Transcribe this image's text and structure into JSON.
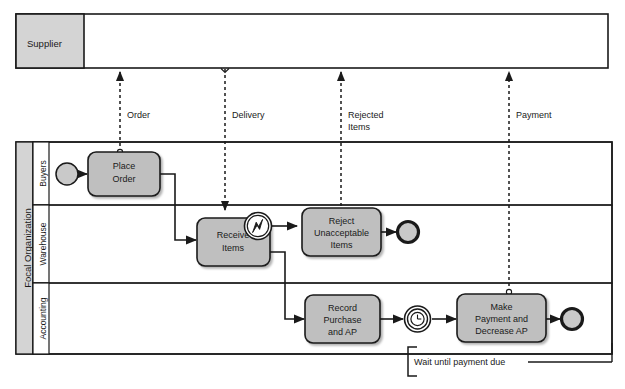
{
  "diagram": {
    "type": "bpmn-collaboration-diagram",
    "colors": {
      "lane_header_fill": "#d4d4d4",
      "task_fill": "#bfbfbf",
      "event_fill": "#c9c9c9",
      "stroke": "#1a1a1a",
      "background": "#ffffff"
    }
  },
  "pools": [
    {
      "id": "supplier",
      "name": "Supplier",
      "collapsed": true,
      "lanes": []
    },
    {
      "id": "focal-organization",
      "name": "Focal Organization",
      "collapsed": false,
      "lanes": [
        {
          "id": "buyers",
          "name": "Buyers"
        },
        {
          "id": "warehouse",
          "name": "Warehouse"
        },
        {
          "id": "accounting",
          "name": "Accounting"
        }
      ]
    }
  ],
  "tasks": [
    {
      "id": "place-order",
      "lane": "buyers",
      "line1": "Place",
      "line2": "Order",
      "line3": ""
    },
    {
      "id": "receive-items",
      "lane": "warehouse",
      "line1": "Receive",
      "line2": "Items",
      "line3": ""
    },
    {
      "id": "reject-unacceptable-items",
      "lane": "warehouse",
      "line1": "Reject",
      "line2": "Unacceptable",
      "line3": "Items"
    },
    {
      "id": "record-purchase-and-ap",
      "lane": "accounting",
      "line1": "Record",
      "line2": "Purchase",
      "line3": "and AP"
    },
    {
      "id": "make-payment-and-decrease-ap",
      "lane": "accounting",
      "line1": "Make",
      "line2": "Payment and",
      "line3": "Decrease AP"
    }
  ],
  "events": [
    {
      "id": "start-event-buyers",
      "kind": "start",
      "lane": "buyers"
    },
    {
      "id": "boundary-error-receive-items",
      "kind": "boundary-error",
      "lane": "warehouse"
    },
    {
      "id": "end-event-warehouse",
      "kind": "end",
      "lane": "warehouse"
    },
    {
      "id": "timer-intermediate-event",
      "kind": "timer-intermediate",
      "lane": "accounting"
    },
    {
      "id": "end-event-accounting",
      "kind": "end",
      "lane": "accounting"
    }
  ],
  "message_flows": [
    {
      "id": "order",
      "label": "Order",
      "direction": "to-supplier"
    },
    {
      "id": "delivery",
      "label": "Delivery",
      "direction": "from-supplier"
    },
    {
      "id": "rejected-items",
      "label_line1": "Rejected",
      "label_line2": "Items",
      "direction": "to-supplier"
    },
    {
      "id": "payment",
      "label": "Payment",
      "direction": "to-supplier"
    }
  ],
  "annotations": [
    {
      "id": "wait-until-payment-due",
      "text": "Wait until payment due"
    }
  ]
}
